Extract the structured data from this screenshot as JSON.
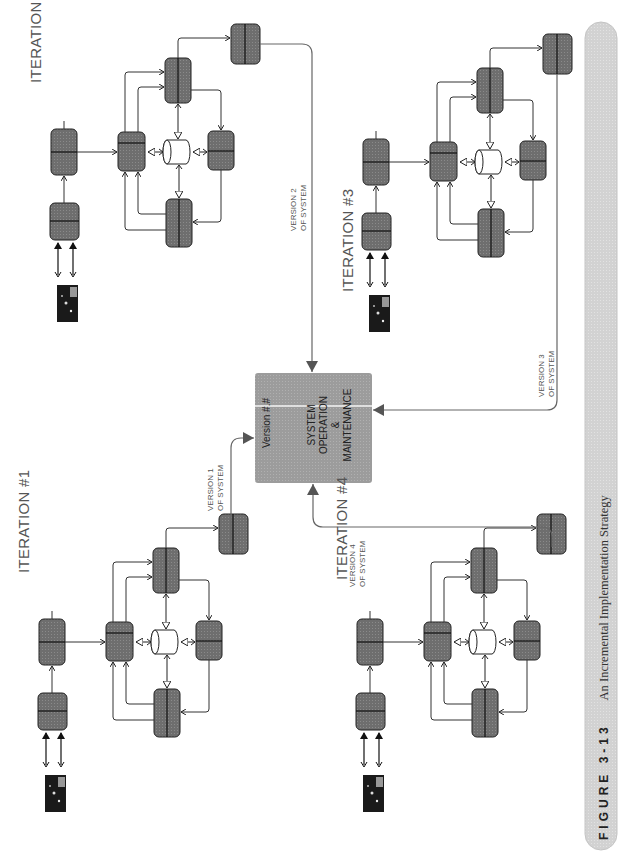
{
  "figure": {
    "number_label": "FIGURE 3-13",
    "title": "An Incremental Implementation Strategy"
  },
  "center": {
    "version_label": "Version #.#",
    "lines": [
      "SYSTEM",
      "OPERATION",
      "&",
      "MAINTENANCE"
    ],
    "fill": "#9a9a9a"
  },
  "iterations": [
    {
      "id": 1,
      "title": "ITERATION #1",
      "version_label": [
        "VERSION 1",
        "OF SYSTEM"
      ]
    },
    {
      "id": 2,
      "title": "ITERATION #2",
      "version_label": [
        "VERSION 2",
        "OF SYSTEM"
      ]
    },
    {
      "id": 3,
      "title": "ITERATION #3",
      "version_label": [
        "VERSION 3",
        "OF SYSTEM"
      ]
    },
    {
      "id": 4,
      "title": "ITERATION #4",
      "version_label": [
        "VERSION 4",
        "OF SYSTEM"
      ]
    }
  ],
  "colors": {
    "process_box": "#6e6e6e",
    "box_stroke": "#222222",
    "datastore": "#ffffff",
    "caption_bar": "#d4d4d4",
    "connector": "#333333",
    "version_arrow": "#666666"
  },
  "orientation": "rotated -90 degrees (text reads bottom-to-top)"
}
